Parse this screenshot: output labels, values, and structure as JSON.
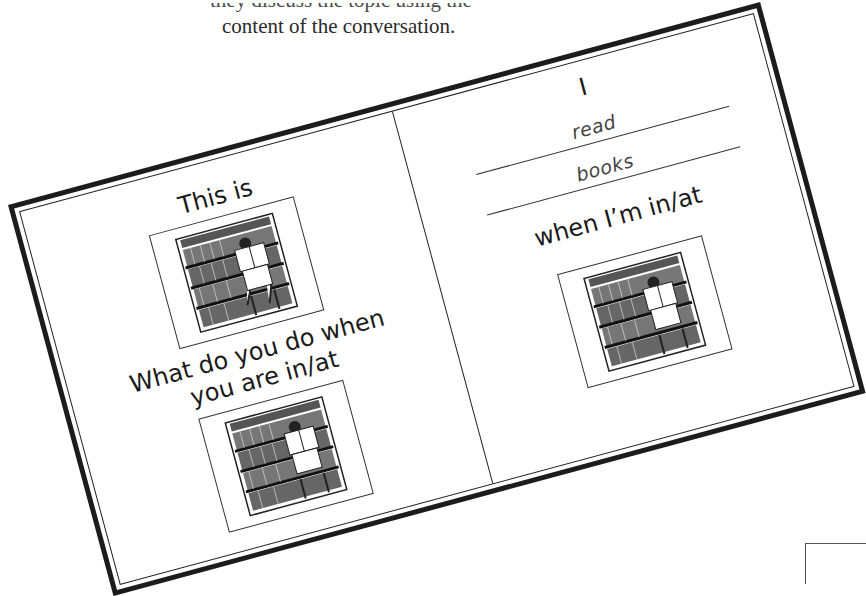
{
  "caption": {
    "clipped_line": "they discuss the topic using the",
    "main_line": "content of the conversation."
  },
  "card": {
    "left_panel": {
      "heading": "This is",
      "question_line1": "What do you do when",
      "question_line2": "you are in/at",
      "images": [
        {
          "icon": "library-reading-illustration",
          "description": "person reading a book in front of library bookshelves"
        },
        {
          "icon": "library-reading-illustration",
          "description": "person reading a book in front of library bookshelves"
        }
      ]
    },
    "right_panel": {
      "subject": "I",
      "answer_verb": "read",
      "answer_object": "books",
      "closing": "when I’m in/at",
      "images": [
        {
          "icon": "library-reading-illustration",
          "description": "person reading a book in front of library bookshelves"
        }
      ]
    }
  },
  "colors": {
    "border": "#1c1c1c",
    "text": "#1a1a1a",
    "handwriting": "#444444",
    "background": "#ffffff"
  }
}
